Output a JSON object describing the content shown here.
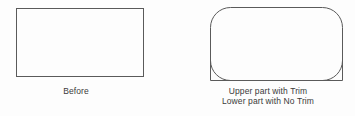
{
  "canvas": {
    "width": 355,
    "height": 116,
    "background": "#fdfdfd",
    "stroke_color": "#5a5a5a",
    "text_color": "#3a3a3a"
  },
  "figures": {
    "before": {
      "shape_name": "plain-rectangle",
      "caption_lines": [
        "Before"
      ]
    },
    "after": {
      "shape_name": "fillet-rounded-rectangle",
      "caption_lines": [
        "Upper part with Trim",
        "Lower part with No Trim"
      ]
    }
  }
}
